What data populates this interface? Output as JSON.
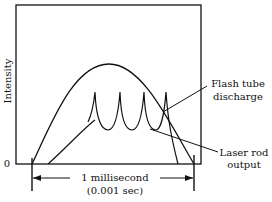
{
  "figure": {
    "y_axis_label": "Intensity",
    "y_origin_label": "0",
    "duration_label_line1": "1 millisecond",
    "duration_label_line2": "(0.001 sec)",
    "callouts": {
      "flash_tube": {
        "line1": "Flash tube",
        "line2": "discharge"
      },
      "laser_rod": {
        "line1": "Laser rod",
        "line2": "output"
      }
    },
    "colors": {
      "ink": "#111111",
      "background": "#ffffff"
    }
  }
}
